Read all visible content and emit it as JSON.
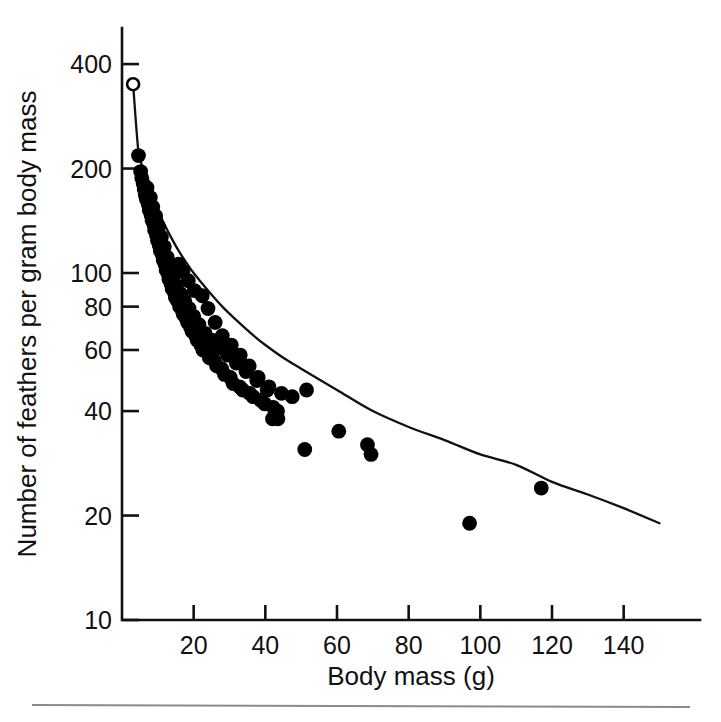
{
  "figure": {
    "background_color": "#ffffff",
    "foreground_color": "#000000",
    "footer_rule_color": "#8a8a8a"
  },
  "chart_data": {
    "type": "scatter",
    "title": "",
    "xlabel": "Body mass (g)",
    "ylabel": "Number of feathers per gram body mass",
    "xscale": "linear",
    "yscale": "log",
    "xlim": [
      0,
      157
    ],
    "ylim": [
      10,
      470
    ],
    "grid": false,
    "legend": null,
    "xticks": [
      20,
      40,
      60,
      80,
      100,
      120,
      140
    ],
    "xtick_labels": [
      "20",
      "40",
      "60",
      "80",
      "100",
      "120",
      "140"
    ],
    "yticks": [
      10,
      20,
      40,
      60,
      80,
      100,
      200,
      400
    ],
    "ytick_labels": [
      "10",
      "20",
      "40",
      "60",
      "80",
      "100",
      "200",
      "400"
    ],
    "series": [
      {
        "name": "open-circle-point",
        "marker": "open-circle",
        "points": [
          [
            3.1,
            350
          ]
        ]
      },
      {
        "name": "feather-density-observations",
        "marker": "filled-circle",
        "points": [
          [
            4.6,
            218
          ],
          [
            5.2,
            196
          ],
          [
            5.5,
            188
          ],
          [
            5.9,
            181
          ],
          [
            6.2,
            174
          ],
          [
            6.5,
            168
          ],
          [
            6.8,
            163
          ],
          [
            7.0,
            176
          ],
          [
            7.3,
            158
          ],
          [
            7.6,
            152
          ],
          [
            7.9,
            165
          ],
          [
            8.1,
            147
          ],
          [
            8.4,
            142
          ],
          [
            8.6,
            155
          ],
          [
            8.9,
            138
          ],
          [
            9.1,
            133
          ],
          [
            9.4,
            146
          ],
          [
            9.6,
            129
          ],
          [
            9.9,
            124
          ],
          [
            10.2,
            136
          ],
          [
            10.4,
            120
          ],
          [
            10.7,
            116
          ],
          [
            11.0,
            127
          ],
          [
            11.2,
            113
          ],
          [
            11.5,
            109
          ],
          [
            11.8,
            119
          ],
          [
            12.0,
            106
          ],
          [
            12.3,
            102
          ],
          [
            12.6,
            111
          ],
          [
            12.9,
            99
          ],
          [
            13.1,
            96
          ],
          [
            13.4,
            104
          ],
          [
            13.7,
            93
          ],
          [
            14.0,
            90
          ],
          [
            14.3,
            97
          ],
          [
            14.6,
            88
          ],
          [
            14.9,
            85
          ],
          [
            15.2,
            92
          ],
          [
            15.5,
            83
          ],
          [
            15.8,
            106
          ],
          [
            16.1,
            80
          ],
          [
            16.4,
            87
          ],
          [
            16.8,
            78
          ],
          [
            17.1,
            76
          ],
          [
            17.5,
            83
          ],
          [
            17.9,
            74
          ],
          [
            18.3,
            72
          ],
          [
            18.7,
            79
          ],
          [
            19.1,
            70
          ],
          [
            19.5,
            68
          ],
          [
            20.0,
            75
          ],
          [
            20.5,
            66
          ],
          [
            21.0,
            64
          ],
          [
            21.5,
            71
          ],
          [
            22.0,
            62
          ],
          [
            22.6,
            60
          ],
          [
            23.2,
            67
          ],
          [
            23.8,
            59
          ],
          [
            24.4,
            57
          ],
          [
            25.0,
            64
          ],
          [
            25.7,
            56
          ],
          [
            26.4,
            54
          ],
          [
            27.1,
            61
          ],
          [
            27.8,
            53
          ],
          [
            28.6,
            51
          ],
          [
            29.4,
            58
          ],
          [
            30.2,
            50
          ],
          [
            31.0,
            48
          ],
          [
            31.9,
            55
          ],
          [
            32.8,
            47
          ],
          [
            33.7,
            46
          ],
          [
            34.6,
            52
          ],
          [
            35.6,
            45
          ],
          [
            36.6,
            44
          ],
          [
            37.6,
            49
          ],
          [
            38.7,
            43
          ],
          [
            39.8,
            42
          ],
          [
            41.0,
            47
          ],
          [
            42.2,
            41
          ],
          [
            43.4,
            40
          ],
          [
            22.4,
            86
          ],
          [
            24.0,
            79
          ],
          [
            26.0,
            72
          ],
          [
            28.0,
            66
          ],
          [
            30.5,
            62
          ],
          [
            33.0,
            58
          ],
          [
            35.5,
            54
          ],
          [
            38.0,
            50
          ],
          [
            40.5,
            46
          ],
          [
            17.0,
            101
          ],
          [
            18.5,
            95
          ],
          [
            20.2,
            89
          ],
          [
            42.0,
            38
          ],
          [
            43.5,
            38
          ],
          [
            44.5,
            45
          ],
          [
            47.5,
            44
          ],
          [
            51.5,
            46
          ],
          [
            51.0,
            31
          ],
          [
            60.5,
            35
          ],
          [
            68.5,
            32
          ],
          [
            69.5,
            30
          ],
          [
            97.0,
            19
          ],
          [
            117.0,
            24
          ]
        ]
      }
    ],
    "fit_curve": {
      "name": "power-law-fit",
      "description": "smooth declining fit line through the scatter",
      "points": [
        [
          3.1,
          350
        ],
        [
          4.5,
          228
        ],
        [
          5.5,
          205
        ],
        [
          6.5,
          190
        ],
        [
          7.5,
          177
        ],
        [
          8.5,
          166
        ],
        [
          10,
          152
        ],
        [
          12,
          137
        ],
        [
          14,
          125
        ],
        [
          16,
          115
        ],
        [
          18,
          107
        ],
        [
          20,
          100
        ],
        [
          24,
          89
        ],
        [
          28,
          80
        ],
        [
          32,
          73
        ],
        [
          36,
          67
        ],
        [
          40,
          62
        ],
        [
          45,
          57
        ],
        [
          50,
          53
        ],
        [
          60,
          46
        ],
        [
          70,
          40
        ],
        [
          80,
          36
        ],
        [
          90,
          33
        ],
        [
          100,
          30
        ],
        [
          110,
          28
        ],
        [
          120,
          25
        ],
        [
          130,
          23
        ],
        [
          140,
          21
        ],
        [
          150,
          19
        ]
      ]
    }
  }
}
